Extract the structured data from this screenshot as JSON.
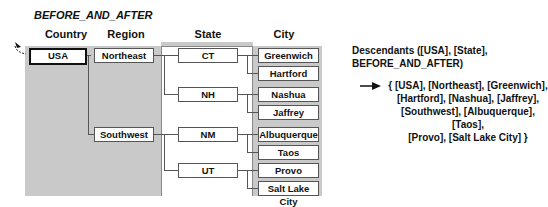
{
  "title": "BEFORE_AND_AFTER",
  "columns": [
    "Country",
    "Region",
    "State",
    "City"
  ],
  "tree": {
    "country": "USA",
    "regions": [
      {
        "name": "Northeast",
        "states": [
          {
            "name": "CT",
            "cities": [
              "Greenwich",
              "Hartford"
            ]
          },
          {
            "name": "NH",
            "cities": [
              "Nashua",
              "Jaffrey"
            ]
          }
        ]
      },
      {
        "name": "Southwest",
        "states": [
          {
            "name": "NM",
            "cities": [
              "Albuquerque",
              "Taos"
            ]
          },
          {
            "name": "UT",
            "cities": [
              "Provo",
              "Salt Lake City"
            ]
          }
        ]
      }
    ]
  },
  "description": {
    "line1": "Descendants ([USA], [State],",
    "line2": "BEFORE_AND_AFTER)"
  },
  "result": {
    "arrow": "→",
    "lines": [
      "{ [USA], [Northeast], [Greenwich],",
      "[Hartford], [Nashua], [Jaffrey],",
      "[Southwest], [Albuquerque], [Taos],",
      "[Provo], [Salt Lake City] }"
    ]
  },
  "colors": {
    "shade": "#c9c9c9",
    "line": "#555555"
  }
}
